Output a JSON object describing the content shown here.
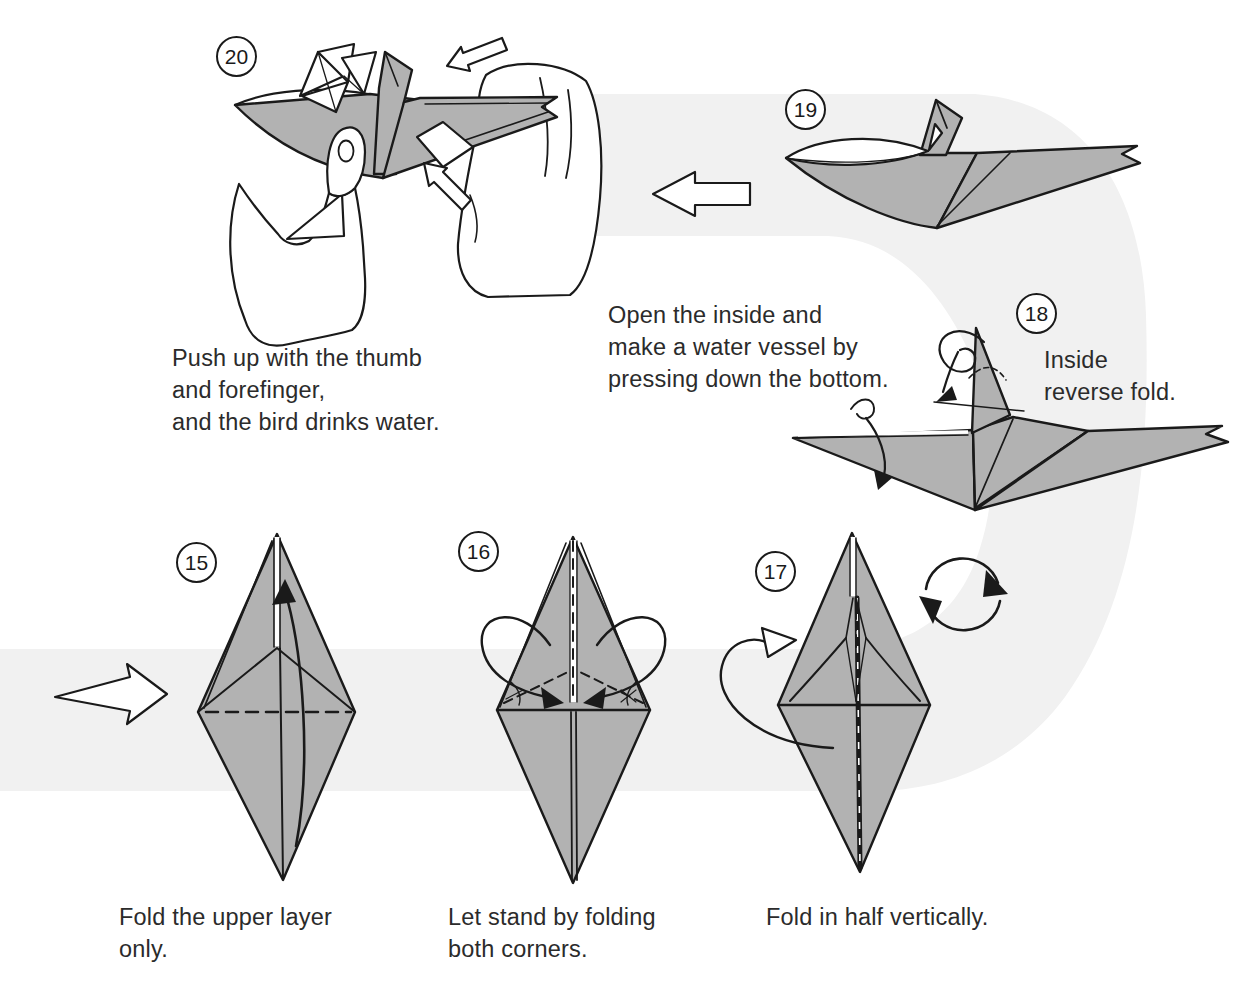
{
  "colors": {
    "paper": "#b2b2b2",
    "band": "#f1f1f1",
    "ink": "#1a1a1a",
    "text": "#2b2b2b",
    "white": "#ffffff"
  },
  "steps": {
    "s15": {
      "number": "15",
      "caption": "Fold the upper layer\nonly."
    },
    "s16": {
      "number": "16",
      "caption": "Let stand by folding\nboth corners."
    },
    "s17": {
      "number": "17",
      "caption": "Fold in half vertically."
    },
    "s18": {
      "number": "18",
      "label": "Inside\nreverse fold.",
      "note": "Open the inside and\nmake a water vessel by\npressing down the bottom."
    },
    "s19": {
      "number": "19"
    },
    "s20": {
      "number": "20",
      "caption": "Push up with the thumb\nand forefinger,\nand the bird drinks water."
    }
  }
}
